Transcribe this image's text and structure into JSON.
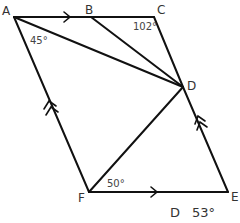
{
  "diagram": {
    "vertices": [
      {
        "name": "A",
        "x": 14,
        "y": 17
      },
      {
        "name": "B",
        "x": 91,
        "y": 17
      },
      {
        "name": "C",
        "x": 154,
        "y": 17
      },
      {
        "name": "D",
        "x": 183,
        "y": 87
      },
      {
        "name": "E",
        "x": 228,
        "y": 192
      },
      {
        "name": "F",
        "x": 89,
        "y": 192
      }
    ],
    "labels": {
      "A": "A",
      "B": "B",
      "C": "C",
      "D": "D",
      "E": "E",
      "F": "F"
    },
    "angles": {
      "at_A": "45°",
      "at_C": "102°",
      "at_F": "50°"
    },
    "caption": {
      "letter": "D",
      "value": "53°"
    },
    "segments": [
      "AB",
      "BC",
      "CD",
      "DE",
      "EF",
      "FA",
      "AD",
      "BD",
      "FD"
    ],
    "parallel_marks": {
      "single_arrow": [
        "AB",
        "FE"
      ],
      "double_arrow": [
        "AF",
        "ED"
      ]
    },
    "stroke_color": "#111111"
  }
}
